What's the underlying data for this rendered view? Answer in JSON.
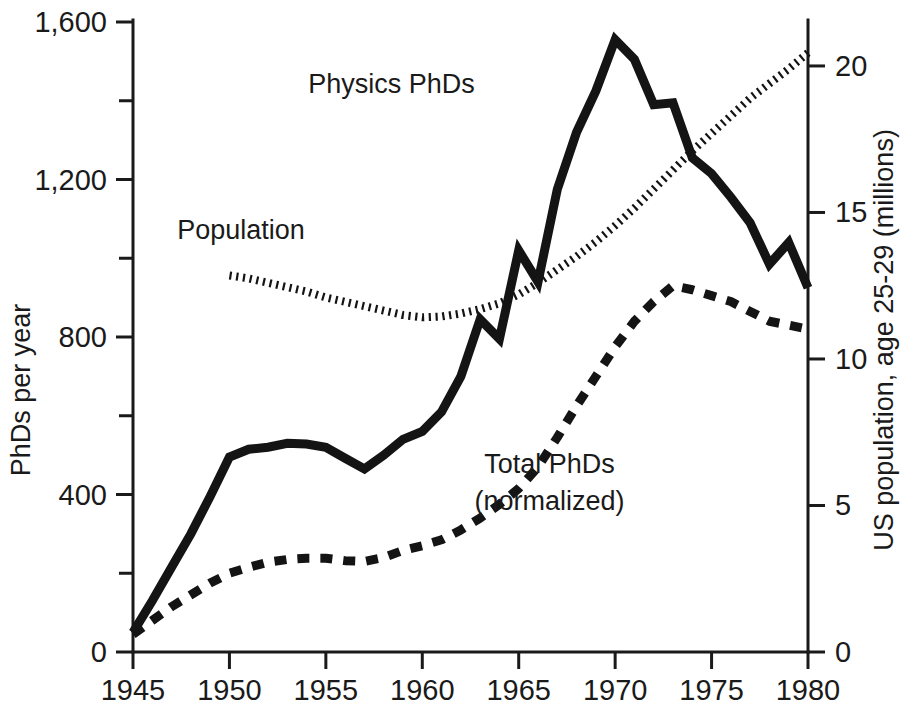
{
  "chart_data": {
    "type": "line",
    "title": "",
    "xlabel": "",
    "ylabel": "PhDs per year",
    "y2label": "US population, age 25-29 (millions)",
    "xlim": [
      1945,
      1980
    ],
    "ylim": [
      0,
      1600
    ],
    "y2lim": [
      0,
      21.5
    ],
    "xticks": [
      1945,
      1950,
      1955,
      1960,
      1965,
      1970,
      1975,
      1980
    ],
    "xtick_labels": [
      "1945",
      "1950",
      "1955",
      "1960",
      "1965",
      "1970",
      "1975",
      "1980"
    ],
    "yticks": [
      0,
      200,
      400,
      600,
      800,
      1000,
      1200,
      1400,
      1600
    ],
    "ytick_labels": [
      "0",
      "",
      "400",
      "",
      "800",
      "",
      "1,200",
      "",
      "1,600"
    ],
    "y2ticks": [
      0,
      5,
      10,
      15,
      20
    ],
    "y2tick_labels": [
      "0",
      "5",
      "10",
      "15",
      "20"
    ],
    "grid": false,
    "legend_position": "inline-annotations",
    "series": [
      {
        "name": "Physics PhDs",
        "axis": "left",
        "style": "solid",
        "label_x": 1958.4,
        "label_y": 1420,
        "x": [
          1945,
          1946,
          1947,
          1948,
          1949,
          1950,
          1951,
          1952,
          1953,
          1954,
          1955,
          1956,
          1957,
          1958,
          1959,
          1960,
          1961,
          1962,
          1963,
          1964,
          1965,
          1966,
          1967,
          1968,
          1969,
          1970,
          1971,
          1972,
          1973,
          1974,
          1975,
          1976,
          1977,
          1978,
          1979,
          1980
        ],
        "y": [
          50,
          130,
          215,
          300,
          395,
          495,
          515,
          520,
          530,
          528,
          520,
          492,
          465,
          500,
          540,
          560,
          610,
          700,
          845,
          795,
          1020,
          940,
          1175,
          1320,
          1425,
          1555,
          1505,
          1390,
          1395,
          1255,
          1215,
          1155,
          1090,
          985,
          1040,
          925
        ]
      },
      {
        "name": "Total PhDs (normalized)",
        "axis": "left",
        "style": "dashed",
        "label_x": 1966.6,
        "label_y": 455,
        "label_line2": "(normalized)",
        "x": [
          1945,
          1946,
          1947,
          1948,
          1949,
          1950,
          1951,
          1952,
          1953,
          1954,
          1955,
          1956,
          1957,
          1958,
          1959,
          1960,
          1961,
          1962,
          1963,
          1964,
          1965,
          1966,
          1967,
          1968,
          1969,
          1970,
          1971,
          1972,
          1973,
          1974,
          1975,
          1976,
          1977,
          1978,
          1979,
          1980
        ],
        "y": [
          45,
          80,
          115,
          145,
          175,
          200,
          215,
          228,
          235,
          238,
          238,
          232,
          230,
          240,
          258,
          270,
          285,
          310,
          340,
          375,
          415,
          470,
          545,
          625,
          700,
          775,
          840,
          890,
          930,
          920,
          905,
          890,
          865,
          840,
          830,
          820
        ]
      },
      {
        "name": "Population",
        "axis": "right",
        "style": "dotted",
        "label_x": 1950.6,
        "label_y_right": 14.1,
        "x": [
          1950,
          1951,
          1952,
          1953,
          1954,
          1955,
          1956,
          1957,
          1958,
          1959,
          1960,
          1961,
          1962,
          1963,
          1964,
          1965,
          1966,
          1967,
          1968,
          1969,
          1970,
          1971,
          1972,
          1973,
          1974,
          1975,
          1976,
          1977,
          1978,
          1979,
          1980
        ],
        "y": [
          12.85,
          12.75,
          12.6,
          12.45,
          12.3,
          12.1,
          11.95,
          11.8,
          11.65,
          11.5,
          11.42,
          11.45,
          11.55,
          11.7,
          11.9,
          12.2,
          12.6,
          13.05,
          13.5,
          14.0,
          14.55,
          15.15,
          15.8,
          16.45,
          17.1,
          17.7,
          18.3,
          18.9,
          19.4,
          19.9,
          20.45
        ]
      }
    ]
  },
  "labels": {
    "physics": "Physics PhDs",
    "population": "Population",
    "total_line1": "Total PhDs",
    "total_line2": "(normalized)",
    "y_axis_title": "PhDs per year",
    "y2_axis_title": "US population, age 25-29 (millions)"
  },
  "colors": {
    "ink": "#141414",
    "background": "#ffffff"
  }
}
